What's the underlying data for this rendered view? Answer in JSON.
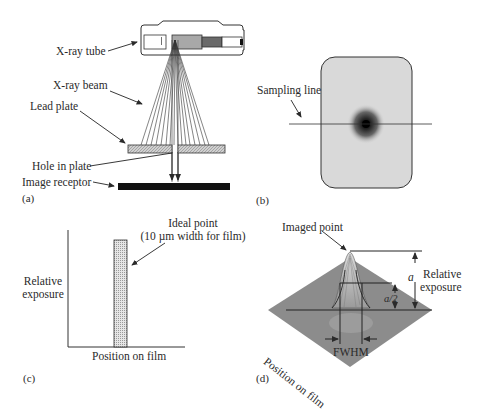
{
  "panels": {
    "a": {
      "panel_label": "(a)",
      "labels": {
        "xray_tube": "X-ray tube",
        "xray_beam": "X-ray beam",
        "lead_plate": "Lead plate",
        "hole_in_plate": "Hole in plate",
        "image_receptor": "Image receptor"
      }
    },
    "b": {
      "panel_label": "(b)",
      "labels": {
        "sampling_line": "Sampling line"
      }
    },
    "c": {
      "panel_label": "(c)",
      "labels": {
        "ideal_point_line1": "Ideal point",
        "ideal_point_line2": "(10 µm width for film)",
        "y_axis_line1": "Relative",
        "y_axis_line2": "exposure",
        "x_axis": "Position on film"
      }
    },
    "d": {
      "panel_label": "(d)",
      "labels": {
        "imaged_point": "Imaged point",
        "a": "a",
        "a_half": "a/2",
        "relative_line1": "Relative",
        "relative_line2": "exposure",
        "position_on_film": "Position on film",
        "fwhm": "FWHM"
      }
    }
  },
  "colors": {
    "ink": "#2a2a2a",
    "film_gray": "#d8d8d8",
    "surface_gray": "#8a8a8a",
    "receptor_black": "#111111"
  }
}
